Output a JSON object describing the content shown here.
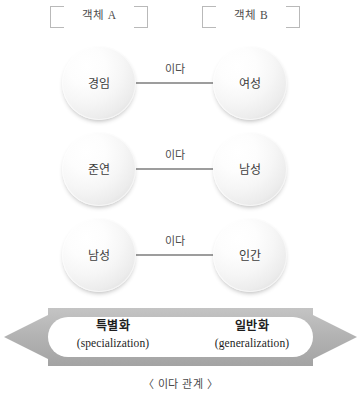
{
  "headers": {
    "left": "객체 A",
    "right": "객체 B"
  },
  "relations": [
    {
      "source": "경임",
      "label": "이다",
      "target": "여성"
    },
    {
      "source": "준연",
      "label": "이다",
      "target": "남성"
    },
    {
      "source": "남성",
      "label": "이다",
      "target": "인간"
    }
  ],
  "axis": {
    "left": {
      "ko": "특별화",
      "en": "(specialization)"
    },
    "right": {
      "ko": "일반화",
      "en": "(generalization)"
    }
  },
  "caption": "〈 이다 관계 〉",
  "colors": {
    "line": "#9d9d9d",
    "bracket": "#b9b9b9",
    "arrow": "#b0b0b0",
    "text": "#3d3d3d"
  }
}
